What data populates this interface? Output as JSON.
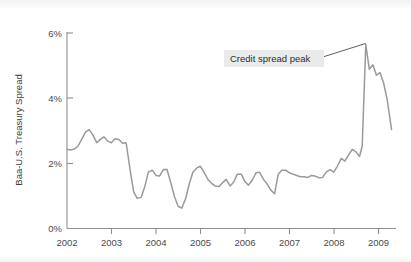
{
  "chart_data": {
    "type": "line",
    "title": "",
    "xlabel": "",
    "ylabel": "Baa-U.S. Treasury Spread",
    "xlim": [
      2002.0,
      2009.4
    ],
    "ylim": [
      0,
      6
    ],
    "grid": false,
    "legend": "none",
    "line_color": "#9a9a9a",
    "x_tick_labels": [
      "2002",
      "2003",
      "2004",
      "2005",
      "2006",
      "2007",
      "2008",
      "2009"
    ],
    "x_tick_values": [
      2002,
      2003,
      2004,
      2005,
      2006,
      2007,
      2008,
      2009
    ],
    "y_tick_labels": [
      "0%",
      "2%",
      "4%",
      "6%"
    ],
    "y_tick_values": [
      0,
      2,
      4,
      6
    ],
    "annotations": [
      {
        "label": "Credit spread peak",
        "box_color": "#e9eaea",
        "target_x": 2008.72,
        "target_y": 5.62
      }
    ],
    "series": [
      {
        "name": "Baa-U.S. Treasury Spread",
        "x": [
          2002.0,
          2002.08,
          2002.17,
          2002.25,
          2002.33,
          2002.42,
          2002.5,
          2002.58,
          2002.67,
          2002.75,
          2002.83,
          2002.92,
          2003.0,
          2003.08,
          2003.17,
          2003.25,
          2003.33,
          2003.42,
          2003.5,
          2003.58,
          2003.67,
          2003.75,
          2003.83,
          2003.92,
          2004.0,
          2004.08,
          2004.17,
          2004.25,
          2004.33,
          2004.42,
          2004.5,
          2004.58,
          2004.67,
          2004.75,
          2004.83,
          2004.92,
          2005.0,
          2005.08,
          2005.17,
          2005.25,
          2005.33,
          2005.42,
          2005.5,
          2005.58,
          2005.67,
          2005.75,
          2005.83,
          2005.92,
          2006.0,
          2006.08,
          2006.17,
          2006.25,
          2006.33,
          2006.42,
          2006.5,
          2006.58,
          2006.67,
          2006.75,
          2006.83,
          2006.92,
          2007.0,
          2007.08,
          2007.17,
          2007.25,
          2007.33,
          2007.42,
          2007.5,
          2007.58,
          2007.67,
          2007.75,
          2007.83,
          2007.92,
          2008.0,
          2008.08,
          2008.17,
          2008.25,
          2008.33,
          2008.42,
          2008.5,
          2008.58,
          2008.64,
          2008.72,
          2008.8,
          2008.88,
          2008.96,
          2009.04,
          2009.12,
          2009.2,
          2009.3
        ],
        "y": [
          2.42,
          2.4,
          2.43,
          2.52,
          2.72,
          2.95,
          3.02,
          2.86,
          2.62,
          2.72,
          2.8,
          2.66,
          2.62,
          2.74,
          2.72,
          2.6,
          2.62,
          1.78,
          1.12,
          0.92,
          0.95,
          1.28,
          1.72,
          1.78,
          1.62,
          1.6,
          1.8,
          1.8,
          1.42,
          0.96,
          0.68,
          0.62,
          0.92,
          1.36,
          1.72,
          1.85,
          1.9,
          1.72,
          1.5,
          1.38,
          1.3,
          1.28,
          1.4,
          1.5,
          1.3,
          1.42,
          1.66,
          1.66,
          1.44,
          1.32,
          1.48,
          1.7,
          1.72,
          1.5,
          1.36,
          1.18,
          1.06,
          1.66,
          1.78,
          1.78,
          1.7,
          1.66,
          1.62,
          1.58,
          1.58,
          1.56,
          1.62,
          1.6,
          1.55,
          1.56,
          1.72,
          1.8,
          1.72,
          1.9,
          2.14,
          2.06,
          2.24,
          2.42,
          2.34,
          2.2,
          2.52,
          5.62,
          4.86,
          5.0,
          4.68,
          4.76,
          4.45,
          3.95,
          3.02
        ]
      }
    ]
  },
  "axis": {
    "y_label_text": "Baa-U.S. Treasury Spread"
  }
}
